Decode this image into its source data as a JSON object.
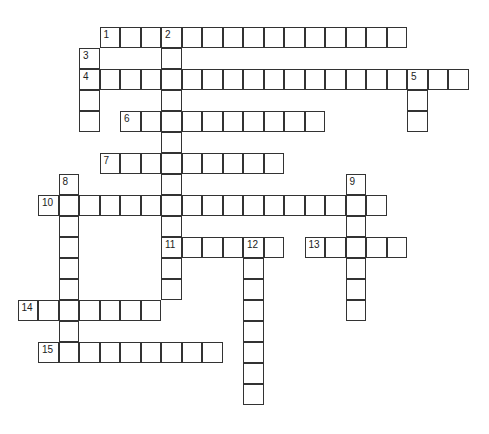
{
  "puzzle": {
    "type": "crossword",
    "origin": {
      "x": 18,
      "y": 27
    },
    "cell_w": 20.5,
    "cell_h": 21,
    "entries": [
      {
        "number": "1",
        "direction": "across",
        "row": 0,
        "col": 4,
        "length": 15
      },
      {
        "number": "2",
        "direction": "down",
        "row": 0,
        "col": 7,
        "length": 13
      },
      {
        "number": "3",
        "direction": "down",
        "row": 1,
        "col": 3,
        "length": 4
      },
      {
        "number": "4",
        "direction": "across",
        "row": 2,
        "col": 3,
        "length": 19
      },
      {
        "number": "5",
        "direction": "down",
        "row": 2,
        "col": 19,
        "length": 3
      },
      {
        "number": "6",
        "direction": "across",
        "row": 4,
        "col": 5,
        "length": 10
      },
      {
        "number": "7",
        "direction": "across",
        "row": 6,
        "col": 4,
        "length": 9
      },
      {
        "number": "8",
        "direction": "down",
        "row": 7,
        "col": 2,
        "length": 8
      },
      {
        "number": "9",
        "direction": "down",
        "row": 7,
        "col": 16,
        "length": 7
      },
      {
        "number": "10",
        "direction": "across",
        "row": 8,
        "col": 1,
        "length": 17
      },
      {
        "number": "11",
        "direction": "across",
        "row": 10,
        "col": 7,
        "length": 6
      },
      {
        "number": "12",
        "direction": "down",
        "row": 10,
        "col": 11,
        "length": 8
      },
      {
        "number": "13",
        "direction": "across",
        "row": 10,
        "col": 14,
        "length": 5
      },
      {
        "number": "14",
        "direction": "across",
        "row": 13,
        "col": 0,
        "length": 7
      },
      {
        "number": "15",
        "direction": "across",
        "row": 15,
        "col": 1,
        "length": 9
      }
    ]
  }
}
